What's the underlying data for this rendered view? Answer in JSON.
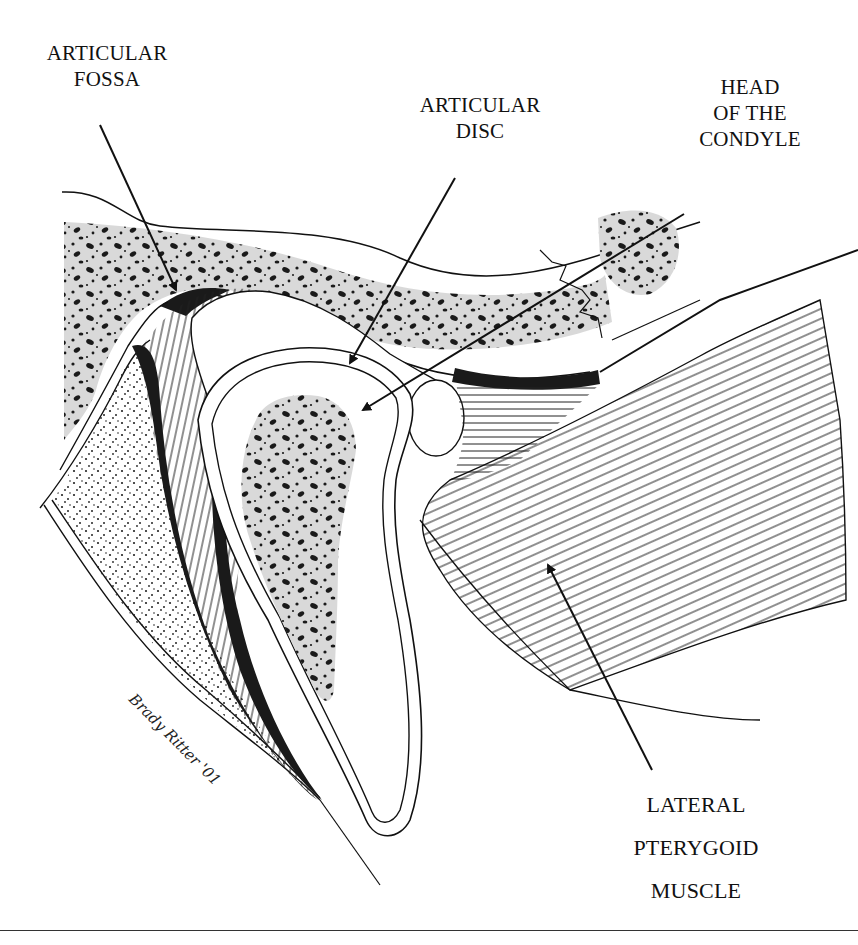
{
  "figure": {
    "labels": {
      "articular_fossa": [
        "ARTICULAR",
        "FOSSA"
      ],
      "articular_disc": [
        "ARTICULAR",
        "DISC"
      ],
      "head_of_condyle": [
        "HEAD",
        "OF THE",
        "CONDYLE"
      ],
      "lateral_pterygoid": [
        "LATERAL",
        "PTERYGOID",
        "MUSCLE"
      ]
    },
    "signature": "Brady Ritter '01",
    "colors": {
      "ink": "#111111",
      "bone_fill": "#d9d9d9",
      "background": "#ffffff"
    }
  }
}
